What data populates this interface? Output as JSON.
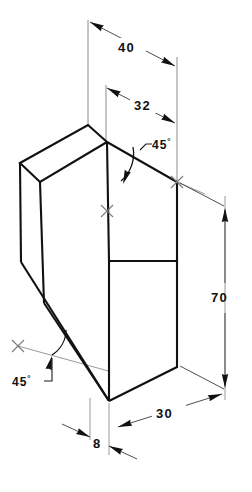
{
  "drawing": {
    "title": "Isometric view of wedge-shaped block",
    "projection": "isometric",
    "units": "mm",
    "line_color": "#111111",
    "dim_color": "#3a3a3a",
    "background": "#ffffff"
  },
  "dimensions": [
    {
      "id": "dim-40",
      "label": "40",
      "value": 40,
      "kind": "linear",
      "orientation": "top-back-oblique",
      "description": "Overall top depth measured along the back upper edge"
    },
    {
      "id": "dim-32",
      "label": "32",
      "value": 32,
      "kind": "linear",
      "orientation": "top-oblique",
      "description": "Depth from front of sloped face to rear face at top"
    },
    {
      "id": "dim-70",
      "label": "70",
      "value": 70,
      "kind": "linear",
      "orientation": "vertical",
      "description": "Overall height of block at right rear edge"
    },
    {
      "id": "dim-30",
      "label": "30",
      "value": 30,
      "kind": "linear",
      "orientation": "bottom-right-oblique",
      "description": "Base width along the lower right edge"
    },
    {
      "id": "dim-8",
      "label": "8",
      "value": 8,
      "kind": "linear",
      "orientation": "bottom-oblique",
      "description": "Narrow base land at the bottom front"
    }
  ],
  "angles": [
    {
      "id": "angle-top-45",
      "label": "45",
      "symbol": "°",
      "value": 45,
      "kind": "angular",
      "location": "upper",
      "description": "Angle of the upper sloped cut face"
    },
    {
      "id": "angle-bottom-45",
      "label": "45",
      "symbol": "°",
      "value": 45,
      "kind": "angular",
      "location": "lower-left",
      "description": "Angle of the lower chamfer cut on the left side"
    }
  ],
  "markers": [
    {
      "id": "center-cross-upper-right",
      "glyph": "×",
      "description": "Centre cross mark at rear upper reference point"
    },
    {
      "id": "center-cross-middle",
      "glyph": "×",
      "description": "Centre cross mark at mid top reference point"
    },
    {
      "id": "center-cross-lower-left",
      "glyph": "×",
      "description": "Centre cross mark at lower left reference point"
    }
  ]
}
